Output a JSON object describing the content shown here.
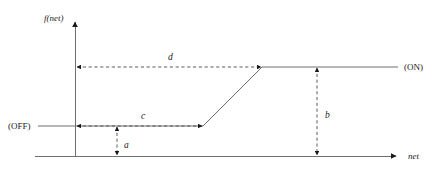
{
  "figure": {
    "type": "diagram",
    "background_color": "#ffffff",
    "line_color": "#6f6f6f",
    "dash_color": "#4a4a4a",
    "text_color": "#1a1a1a"
  },
  "axes": {
    "y_axis_label": "f(net)",
    "x_axis_label": "net",
    "y_axis_x": 75,
    "x_axis_y": 156,
    "y_axis_top": 18,
    "x_axis_right": 400
  },
  "states": {
    "off_label": "(OFF)",
    "on_label": "(ON)"
  },
  "curve": {
    "off_level_y": 126,
    "on_level_y": 67,
    "off_start_x": 38,
    "knee_low_x": 203,
    "knee_high_x": 262,
    "on_end_x": 398
  },
  "measures": [
    {
      "key": "a",
      "label": "a",
      "orientation": "vertical",
      "meaning": "height of OFF level above the net axis",
      "x": 117,
      "y_start": 126,
      "y_end": 156,
      "label_x": 127,
      "label_y": 146
    },
    {
      "key": "b",
      "label": "b",
      "orientation": "vertical",
      "meaning": "height of ON level above the net axis",
      "x": 317,
      "y_start": 67,
      "y_end": 156,
      "label_x": 327,
      "label_y": 116
    },
    {
      "key": "c",
      "label": "c",
      "orientation": "horizontal",
      "meaning": "net value where the ramp begins",
      "y": 126,
      "x_start": 77,
      "x_end": 203,
      "label_x": 143,
      "label_y": 118
    },
    {
      "key": "d",
      "label": "d",
      "orientation": "horizontal",
      "meaning": "net value where the ramp reaches the ON level",
      "y": 67,
      "x_start": 77,
      "x_end": 262,
      "label_x": 170,
      "label_y": 59
    }
  ]
}
